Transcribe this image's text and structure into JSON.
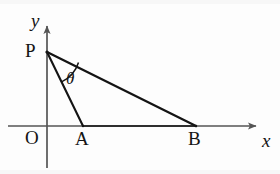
{
  "figure": {
    "background_color": "#fdfdfd",
    "line_color": "#141414",
    "axis_color": "#555555",
    "width": 280,
    "height": 174
  },
  "axes": {
    "x_axis": {
      "label": "x",
      "label_x": 262,
      "label_y": 131,
      "start_x": 8,
      "end_x": 264,
      "y": 126,
      "arrow": "right-arrow-icon"
    },
    "y_axis": {
      "label": "y",
      "label_x": 31,
      "label_y": 11,
      "x": 47,
      "start_y": 168,
      "end_y": 18,
      "arrow": "up-arrow-icon"
    },
    "origin": {
      "label": "O",
      "label_x": 25,
      "label_y": 128,
      "x": 47,
      "y": 126
    }
  },
  "points": [
    {
      "name": "P",
      "label": "P",
      "x": 47,
      "y": 52,
      "label_x": 25,
      "label_y": 41
    },
    {
      "name": "A",
      "label": "A",
      "x": 83,
      "y": 126,
      "label_x": 75,
      "label_y": 129
    },
    {
      "name": "B",
      "label": "B",
      "x": 196,
      "y": 126,
      "label_x": 188,
      "label_y": 129
    }
  ],
  "segments": [
    {
      "name": "PA",
      "from": "P",
      "to": "A",
      "x1": 47,
      "y1": 52,
      "x2": 83,
      "y2": 126
    },
    {
      "name": "PB",
      "from": "P",
      "to": "B",
      "x1": 47,
      "y1": 52,
      "x2": 196,
      "y2": 126
    },
    {
      "name": "AB",
      "from": "A",
      "to": "B",
      "x1": 83,
      "y1": 126,
      "x2": 196,
      "y2": 126
    }
  ],
  "angle": {
    "label": "θ",
    "vertex": "P",
    "between": [
      "PA",
      "PB"
    ],
    "label_x": 66,
    "label_y": 70
  }
}
